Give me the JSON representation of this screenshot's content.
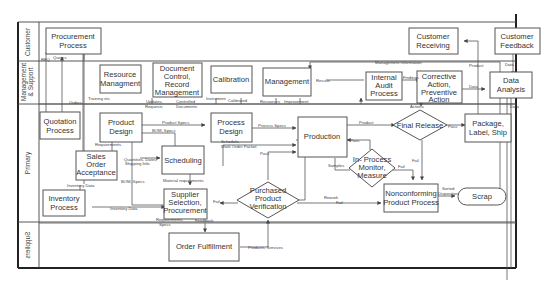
{
  "lanes": [
    {
      "label": "Customer"
    },
    {
      "label": "Management"
    },
    {
      "label": "& Support"
    },
    {
      "label": "Primary"
    },
    {
      "label": "Suppliers"
    }
  ],
  "processes": {
    "procurement": [
      "Procurement",
      "Process"
    ],
    "customer_receiving": [
      "Customer",
      "Receiving"
    ],
    "customer_feedback": [
      "Customer",
      "Feedback"
    ],
    "resource": [
      "Resource",
      "Managment"
    ],
    "doc_control": [
      "Document",
      "Control,",
      "Record",
      "Management"
    ],
    "calibration": [
      "Calibration"
    ],
    "management": [
      "Management"
    ],
    "internal_audit": [
      "Internal",
      "Audit",
      "Process"
    ],
    "capa": [
      "Corrective",
      "Action,",
      "Preventive",
      "Action"
    ],
    "data_analysis": [
      "Data",
      "Analysis"
    ],
    "quotation": [
      "Quotation",
      "Process"
    ],
    "product_design": [
      "Product",
      "Design"
    ],
    "process_design": [
      "Process",
      "Design"
    ],
    "production": [
      "Production"
    ],
    "package": [
      "Package,",
      "Label, Ship"
    ],
    "sales_order": [
      "Sales",
      "Order",
      "Acceptance"
    ],
    "scheduling": [
      "Scheduling"
    ],
    "inventory": [
      "Inventory",
      "Process"
    ],
    "supplier_selection": [
      "Supplier",
      "Selection,",
      "Procurement"
    ],
    "nonconforming": [
      "Nonconforming",
      "Product Process"
    ],
    "order_fulfillment": [
      "Order Fulfillment"
    ]
  },
  "decisions": {
    "final_release": [
      "Final Release"
    ],
    "in_process": [
      "In- Process",
      "Monitor,",
      "Measure"
    ],
    "purchased_verification": [
      "Purchased",
      "Product",
      "Verification"
    ]
  },
  "terminals": {
    "scrap": "Scrap"
  },
  "flow_labels": {
    "rfq": "RFQ",
    "quotes": "Quotes",
    "orders": "Orders",
    "training": "Training etc.",
    "updates": "Updates,",
    "requests": "Requests",
    "controlled": "Controlled",
    "documents": "Documents",
    "instrument": "Instrument",
    "calibrated": "Calibrated",
    "resources": "Resources",
    "improvement": "Improvement",
    "mgmt_info": "Management Information",
    "results": "Results",
    "findings": "Findings",
    "data_capa": "Data",
    "product_top": "Product",
    "data_feedback": "Data",
    "actions": "Actions",
    "data_right": "Data",
    "product_specs": "Product Specs",
    "bom_specs": "BOM, Specs",
    "requirements": "Requirements",
    "quantities": "Quantities, Dates,",
    "shipping": "Shipping Info.",
    "process_specs": "Process Specs",
    "schedule": "Schedule,",
    "work_order": "Work Order Packet",
    "pass_prod": "Pass",
    "product": "Product",
    "pass_final": "Pass",
    "pass_inproc": "Pass",
    "samples": "Samples",
    "fail_final": "Fail",
    "fail_inproc": "Fail",
    "inventory_data_up": "Inventory Data",
    "bom_specs_low": "BOM, Specs",
    "material_req": "Material requirements",
    "inventory_data": "Inventory Data",
    "fail_purchase": "Fail",
    "rework": "Rework",
    "fail_rework": "Fail",
    "sorted": "Sorted",
    "disposition": "Disposition",
    "req_specs1": "Requirements,",
    "req_specs2": "Specs",
    "feedback": "Feedback",
    "products_services": "Products, Services"
  }
}
